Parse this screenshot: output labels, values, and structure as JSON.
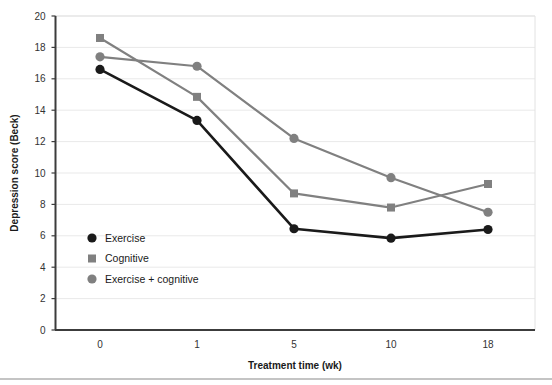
{
  "chart_data": {
    "type": "line",
    "title": "",
    "xlabel": "Treatment time (wk)",
    "ylabel": "Depression score (Beck)",
    "categories": [
      "0",
      "1",
      "5",
      "10",
      "18"
    ],
    "ylim": [
      0,
      20
    ],
    "yticks": [
      0,
      2,
      4,
      6,
      8,
      10,
      12,
      14,
      16,
      18,
      20
    ],
    "ytick_labels": [
      "0",
      "2",
      "4",
      "6",
      "8",
      "10",
      "12",
      "14",
      "16",
      "18",
      "20"
    ],
    "grid": true,
    "legend_position": "inside-lower-left",
    "series": [
      {
        "name": "Exercise",
        "values": [
          16.6,
          13.35,
          6.45,
          5.85,
          6.4
        ],
        "color": "#1a1a1a",
        "marker": "circle"
      },
      {
        "name": "Cognitive",
        "values": [
          18.6,
          14.85,
          8.7,
          7.8,
          9.3
        ],
        "color": "#808080",
        "marker": "square"
      },
      {
        "name": "Exercise + cognitive",
        "values": [
          17.4,
          16.8,
          12.2,
          9.7,
          7.5
        ],
        "color": "#808080",
        "marker": "circle"
      }
    ]
  },
  "legend": {
    "items": [
      {
        "label": "Exercise",
        "marker": "circle",
        "color": "#1a1a1a"
      },
      {
        "label": "Cognitive",
        "marker": "square",
        "color": "#808080"
      },
      {
        "label": "Exercise + cognitive",
        "marker": "circle",
        "color": "#808080"
      }
    ]
  },
  "axes": {
    "y_title": "Depression score (Beck)",
    "x_title": "Treatment time (wk)",
    "y_ticks": [
      "20",
      "18",
      "16",
      "14",
      "12",
      "10",
      "8",
      "6",
      "4",
      "2",
      "0"
    ],
    "x_ticks": [
      "0",
      "1",
      "5",
      "10",
      "18"
    ]
  }
}
